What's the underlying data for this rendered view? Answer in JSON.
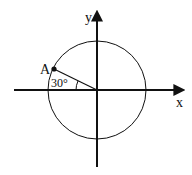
{
  "diagram": {
    "type": "unit-circle",
    "center": {
      "x": 97,
      "y": 90
    },
    "radius": 49,
    "axes": {
      "x_label": "x",
      "y_label": "y"
    },
    "point": {
      "label": "A",
      "angle_label": "30°",
      "angle_deg_from_negative_x": 30
    },
    "colors": {
      "stroke": "#111111",
      "background": "#ffffff"
    }
  }
}
